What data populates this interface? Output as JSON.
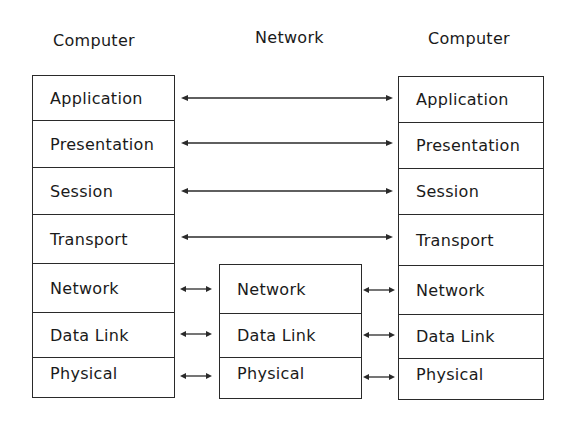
{
  "headings": {
    "left": "Computer",
    "middle": "Network",
    "right": "Computer"
  },
  "left_stack": {
    "layers": [
      "Application",
      "Presentation",
      "Session",
      "Transport",
      "Network",
      "Data Link",
      "Physical"
    ]
  },
  "middle_stack": {
    "layers": [
      "Network",
      "Data Link",
      "Physical"
    ]
  },
  "right_stack": {
    "layers": [
      "Application",
      "Presentation",
      "Session",
      "Transport",
      "Network",
      "Data Link",
      "Physical"
    ]
  },
  "connections": {
    "long_arrows": [
      "Application",
      "Presentation",
      "Session",
      "Transport"
    ],
    "short_arrows_left": [
      "Network",
      "Data Link",
      "Physical"
    ],
    "short_arrows_right": [
      "Network",
      "Data Link",
      "Physical"
    ],
    "arrow_style": "double-headed"
  },
  "colors": {
    "line": "#2a2a2a",
    "text": "#1a1a1a",
    "background": "#ffffff"
  }
}
